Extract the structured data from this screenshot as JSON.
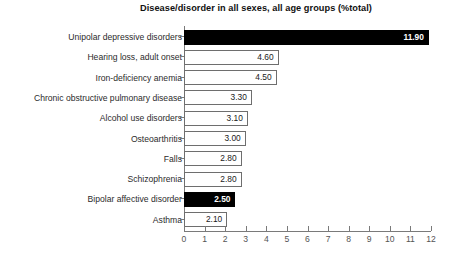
{
  "chart_data": {
    "type": "bar",
    "orientation": "horizontal",
    "title": "Disease/disorder in all sexes, all age groups (%total)",
    "xlabel": "",
    "ylabel": "",
    "xlim": [
      0,
      12
    ],
    "xticks": [
      "0",
      "1",
      "2",
      "3",
      "4",
      "5",
      "6",
      "7",
      "8",
      "9",
      "10",
      "11",
      "12"
    ],
    "grid": false,
    "legend": null,
    "categories": [
      "Unipolar depressive disorders",
      "Hearing loss, adult onset",
      "Iron-deficiency anemia",
      "Chronic obstructive pulmonary disease",
      "Alcohol use disorders",
      "Osteoarthritis",
      "Falls",
      "Schizophrenia",
      "Bipolar affective disorder",
      "Asthma"
    ],
    "values": [
      11.9,
      4.6,
      4.5,
      3.3,
      3.1,
      3.0,
      2.8,
      2.8,
      2.5,
      2.1
    ],
    "value_labels": [
      "11.90",
      "4.60",
      "4.50",
      "3.30",
      "3.10",
      "3.00",
      "2.80",
      "2.80",
      "2.50",
      "2.10"
    ],
    "highlighted": [
      true,
      false,
      false,
      false,
      false,
      false,
      false,
      false,
      true,
      false
    ],
    "colors": {
      "bar_fill_highlight": "#000000",
      "bar_fill_default": "#ffffff",
      "bar_border": "#6e6e6e",
      "axis": "#7a7a7a",
      "label_text": "#2b2b2b",
      "tick_text": "#555555",
      "title_text": "#111111",
      "background": "#ffffff"
    }
  }
}
